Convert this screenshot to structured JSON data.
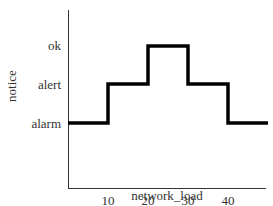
{
  "chart_data": {
    "type": "line",
    "subtype": "step",
    "title": "",
    "xlabel": "network_load",
    "ylabel": "notice",
    "x_ticks": [
      10,
      20,
      30,
      40
    ],
    "x_tick_labels": [
      "10",
      "20",
      "30",
      "40"
    ],
    "y_categories": [
      "alarm",
      "alert",
      "ok"
    ],
    "xlim": [
      0,
      50
    ],
    "grid": false,
    "legend": null,
    "series": [
      {
        "name": "notice",
        "color": "#000000",
        "points": [
          {
            "x": 0,
            "y": "alarm"
          },
          {
            "x": 10,
            "y": "alarm"
          },
          {
            "x": 10,
            "y": "alert"
          },
          {
            "x": 20,
            "y": "alert"
          },
          {
            "x": 20,
            "y": "ok"
          },
          {
            "x": 30,
            "y": "ok"
          },
          {
            "x": 30,
            "y": "alert"
          },
          {
            "x": 40,
            "y": "alert"
          },
          {
            "x": 40,
            "y": "alarm"
          },
          {
            "x": 50,
            "y": "alarm"
          }
        ],
        "segments": [
          {
            "x_start": 0,
            "x_end": 10,
            "value": "alarm"
          },
          {
            "x_start": 10,
            "x_end": 20,
            "value": "alert"
          },
          {
            "x_start": 20,
            "x_end": 30,
            "value": "ok"
          },
          {
            "x_start": 30,
            "x_end": 40,
            "value": "alert"
          },
          {
            "x_start": 40,
            "x_end": 50,
            "value": "alarm"
          }
        ]
      }
    ]
  },
  "colors": {
    "line": "#000000",
    "axis": "#333333",
    "background": "#ffffff"
  }
}
